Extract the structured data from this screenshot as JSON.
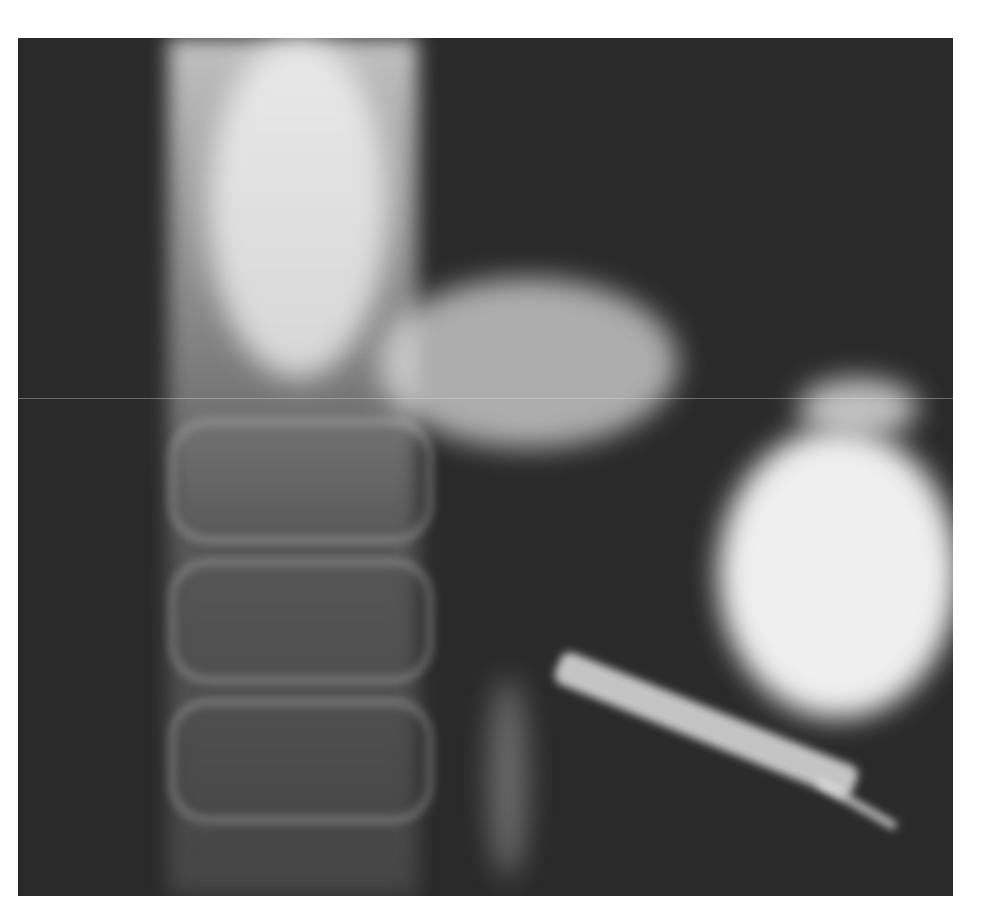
{
  "image": {
    "kind": "grayscale radiograph",
    "colors": {
      "background": "#ffffff",
      "film": "#2a2a2a",
      "contrast": "#f0f0f0"
    }
  }
}
